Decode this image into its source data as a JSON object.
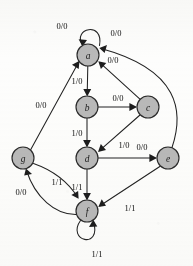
{
  "diagram": {
    "kind": "finite-state-machine-transition-diagram",
    "canvas": {
      "width": 193,
      "height": 266
    },
    "node_radius": 11,
    "colors": {
      "node_fill": "#b9b9b9",
      "node_stroke": "#2a2a2a",
      "edge_stroke": "#222222",
      "label_text": "#111111",
      "background": "#fdfdfc"
    },
    "nodes": [
      {
        "id": "a",
        "label": "a",
        "cx": 88,
        "cy": 55
      },
      {
        "id": "b",
        "label": "b",
        "cx": 87,
        "cy": 107
      },
      {
        "id": "c",
        "label": "c",
        "cx": 148,
        "cy": 107
      },
      {
        "id": "d",
        "label": "d",
        "cx": 87,
        "cy": 158
      },
      {
        "id": "e",
        "label": "e",
        "cx": 168,
        "cy": 158
      },
      {
        "id": "f",
        "label": "f",
        "cx": 87,
        "cy": 211
      },
      {
        "id": "g",
        "label": "g",
        "cx": 23,
        "cy": 158
      }
    ],
    "edges": [
      {
        "id": "a-a",
        "from": "a",
        "to": "a",
        "label": "0/0",
        "label_x": 62,
        "label_y": 26,
        "shape": "self-loop-top"
      },
      {
        "id": "e-a",
        "from": "e",
        "to": "a",
        "label": "0/0",
        "label_x": 116,
        "label_y": 33,
        "shape": "curve-right-tall"
      },
      {
        "id": "c-a",
        "from": "c",
        "to": "a",
        "label": "0/0",
        "label_x": 113,
        "label_y": 60,
        "shape": "line"
      },
      {
        "id": "a-b",
        "from": "a",
        "to": "b",
        "label": "1/0",
        "label_x": 77,
        "label_y": 81,
        "shape": "line"
      },
      {
        "id": "b-c",
        "from": "b",
        "to": "c",
        "label": "0/0",
        "label_x": 118,
        "label_y": 98,
        "shape": "line"
      },
      {
        "id": "b-d",
        "from": "b",
        "to": "d",
        "label": "1/0",
        "label_x": 77,
        "label_y": 133,
        "shape": "line"
      },
      {
        "id": "c-d",
        "from": "c",
        "to": "d",
        "label": "1/0",
        "label_x": 124,
        "label_y": 145,
        "shape": "line"
      },
      {
        "id": "d-e",
        "from": "d",
        "to": "e",
        "label": "0/0",
        "label_x": 142,
        "label_y": 147,
        "shape": "line"
      },
      {
        "id": "d-f",
        "from": "d",
        "to": "f",
        "label": "1/1",
        "label_x": 77,
        "label_y": 187,
        "shape": "line"
      },
      {
        "id": "e-f",
        "from": "e",
        "to": "f",
        "label": "1/1",
        "label_x": 130,
        "label_y": 208,
        "shape": "line"
      },
      {
        "id": "g-a",
        "from": "g",
        "to": "a",
        "label": "0/0",
        "label_x": 41,
        "label_y": 105,
        "shape": "line"
      },
      {
        "id": "g-f",
        "from": "g",
        "to": "f",
        "label": "1/1",
        "label_x": 57,
        "label_y": 182,
        "shape": "curve-lower-left"
      },
      {
        "id": "f-g",
        "from": "f",
        "to": "g",
        "label": "0/0",
        "label_x": 21,
        "label_y": 192,
        "shape": "curve-lower-left-back"
      },
      {
        "id": "f-f",
        "from": "f",
        "to": "f",
        "label": "1/1",
        "label_x": 97,
        "label_y": 254,
        "shape": "self-loop-bottom"
      }
    ]
  }
}
